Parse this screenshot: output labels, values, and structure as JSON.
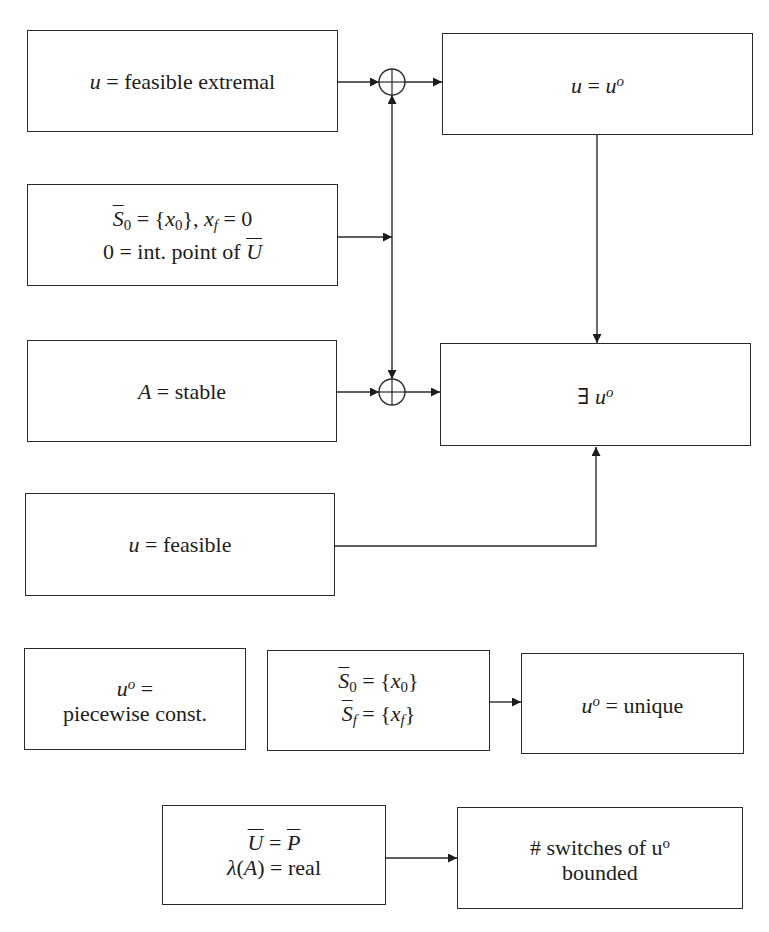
{
  "diagram": {
    "boxes": [
      {
        "position": "row1-left",
        "lines": [
          [
            "u",
            " = feasible extremal"
          ]
        ]
      },
      {
        "position": "row1-right",
        "lines": [
          [
            "u",
            " = ",
            "u",
            "o"
          ]
        ]
      },
      {
        "position": "row2-left",
        "lines": [
          [
            "S",
            "0",
            " = {",
            "x",
            "0",
            "}, ",
            "x",
            "f",
            " = 0"
          ],
          [
            "0 = int. point of ",
            "U"
          ]
        ]
      },
      {
        "position": "row3-left",
        "lines": [
          [
            "A",
            " = stable"
          ]
        ]
      },
      {
        "position": "row3-right",
        "lines": [
          [
            "∃ ",
            "u",
            "o"
          ]
        ]
      },
      {
        "position": "row4-left",
        "lines": [
          [
            "u",
            " = feasible"
          ]
        ]
      },
      {
        "position": "row5-left",
        "lines": [
          [
            "u",
            "o",
            " ="
          ],
          [
            "piecewise const."
          ]
        ]
      },
      {
        "position": "row5-middle",
        "lines": [
          [
            "S",
            "0",
            " = {",
            "x",
            "0",
            "}"
          ],
          [
            "S",
            "f",
            " = {",
            "x",
            "f",
            "}"
          ]
        ]
      },
      {
        "position": "row5-right",
        "lines": [
          [
            "u",
            "o",
            " = unique"
          ]
        ]
      },
      {
        "position": "row6-left",
        "lines": [
          [
            "U",
            " = ",
            "P"
          ],
          [
            "λ",
            "(",
            "A",
            ") = real"
          ]
        ]
      },
      {
        "position": "row6-right",
        "lines": [
          [
            "# switches of u",
            "o"
          ],
          [
            "bounded"
          ]
        ]
      }
    ],
    "junctions": [
      {
        "symbol": "⊕",
        "icon": "circled-plus-icon",
        "position": "top"
      },
      {
        "symbol": "⊕",
        "icon": "circled-plus-icon",
        "position": "bottom"
      }
    ],
    "edges": [
      {
        "from": "box 0 (u = feasible extremal)",
        "to": "junction top",
        "arrow": "end"
      },
      {
        "from": "junction top",
        "to": "box 1 (u = u^o)",
        "arrow": "end"
      },
      {
        "from": "box 2 (S0 = {x0}, xf = 0)",
        "to": "vertical link between junctions",
        "arrow": "end"
      },
      {
        "from": "vertical link",
        "to": "junction top",
        "arrow": "end"
      },
      {
        "from": "vertical link",
        "to": "junction bottom",
        "arrow": "end"
      },
      {
        "from": "box 3 (A = stable)",
        "to": "junction bottom",
        "arrow": "end"
      },
      {
        "from": "junction bottom",
        "to": "box 4 (∃ u^o)",
        "arrow": "end"
      },
      {
        "from": "box 1 (u = u^o)",
        "to": "box 4 (∃ u^o)",
        "arrow": "end"
      },
      {
        "from": "box 5 (u = feasible)",
        "to": "box 4 (∃ u^o)",
        "arrow": "end"
      },
      {
        "from": "box 7 (S0 = {x0}, Sf = {xf})",
        "to": "box 8 (u^o = unique)",
        "arrow": "end"
      },
      {
        "from": "box 9 (U = P, λ(A) = real)",
        "to": "box 10 (# switches of u^o bounded)",
        "arrow": "end"
      }
    ],
    "colors": {
      "stroke": "#2a2a2a",
      "background": "#ffffff",
      "text": "#1c1c1c"
    }
  }
}
